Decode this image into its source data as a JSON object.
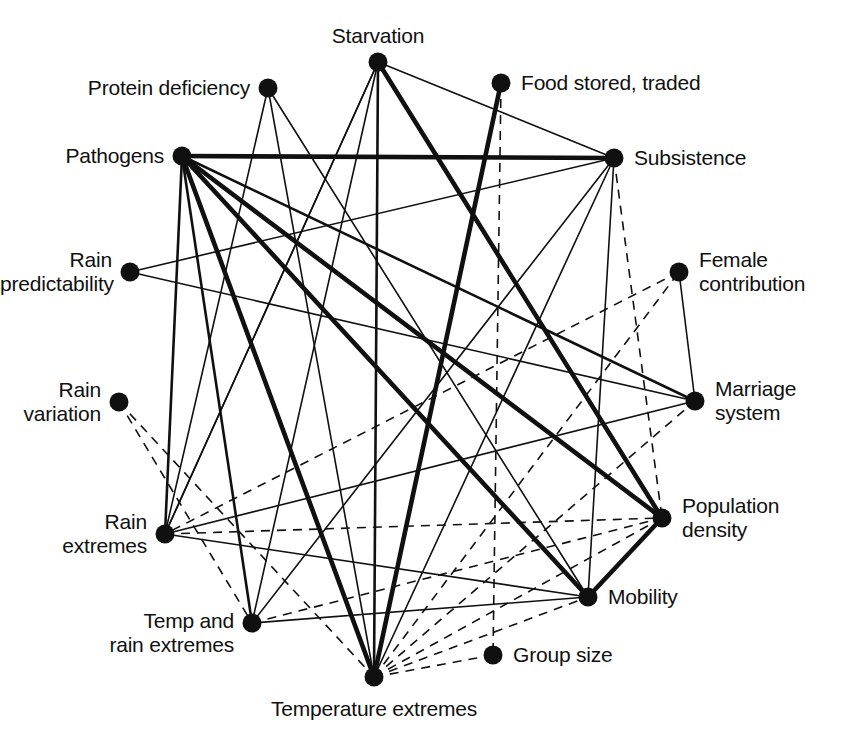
{
  "figure": {
    "type": "network-diagram",
    "title": "",
    "background_color": "#ffffff",
    "ink_color": "#101010",
    "width": 843,
    "height": 736
  },
  "legend_note": {
    "solid_meaning": "solid line",
    "dashed_meaning": "dashed line",
    "thickness_meaning": "line thickness indicates strength of association"
  },
  "nodes": [
    {
      "id": "starvation",
      "label": "Starvation",
      "x": 378,
      "y": 62,
      "label_x": 378,
      "label_y": 24,
      "label_align": "center"
    },
    {
      "id": "protein",
      "label": "Protein deficiency",
      "x": 268,
      "y": 88,
      "label_x": 250,
      "label_y": 76,
      "label_align": "right"
    },
    {
      "id": "food_stored",
      "label": "Food stored, traded",
      "x": 501,
      "y": 83,
      "label_x": 521,
      "label_y": 71,
      "label_align": "left"
    },
    {
      "id": "pathogens",
      "label": "Pathogens",
      "x": 182,
      "y": 156,
      "label_x": 164,
      "label_y": 144,
      "label_align": "right"
    },
    {
      "id": "subsistence",
      "label": "Subsistence",
      "x": 614,
      "y": 158,
      "label_x": 634,
      "label_y": 146,
      "label_align": "left"
    },
    {
      "id": "rain_pred",
      "label": "Rain\npredictability",
      "x": 130,
      "y": 272,
      "label_x": 112,
      "label_y": 248,
      "label_align": "right"
    },
    {
      "id": "female_contrib",
      "label": "Female\ncontribution",
      "x": 679,
      "y": 272,
      "label_x": 699,
      "label_y": 248,
      "label_align": "left"
    },
    {
      "id": "marriage",
      "label": "Marriage\nsystem",
      "x": 695,
      "y": 401,
      "label_x": 715,
      "label_y": 377,
      "label_align": "left"
    },
    {
      "id": "rain_var",
      "label": "Rain\nvariation",
      "x": 119,
      "y": 402,
      "label_x": 101,
      "label_y": 378,
      "label_align": "right"
    },
    {
      "id": "pop_density",
      "label": "Population\ndensity",
      "x": 662,
      "y": 518,
      "label_x": 682,
      "label_y": 494,
      "label_align": "left"
    },
    {
      "id": "rain_extremes",
      "label": "Rain\nextremes",
      "x": 165,
      "y": 534,
      "label_x": 147,
      "label_y": 510,
      "label_align": "right"
    },
    {
      "id": "temp_rain_extr",
      "label": "Temp and\nrain extremes",
      "x": 252,
      "y": 623,
      "label_x": 234,
      "label_y": 609,
      "label_align": "right"
    },
    {
      "id": "mobility",
      "label": "Mobility",
      "x": 588,
      "y": 597,
      "label_x": 608,
      "label_y": 585,
      "label_align": "left"
    },
    {
      "id": "group_size",
      "label": "Group size",
      "x": 493,
      "y": 655,
      "label_x": 513,
      "label_y": 643,
      "label_align": "left"
    },
    {
      "id": "temperature_extr",
      "label": "Temperature extremes",
      "x": 374,
      "y": 677,
      "label_x": 374,
      "label_y": 697,
      "label_align": "center"
    }
  ],
  "edges": [
    {
      "source": "pathogens",
      "target": "subsistence",
      "style": "solid",
      "weight": "thick"
    },
    {
      "source": "pathogens",
      "target": "temperature_extr",
      "style": "solid",
      "weight": "thick"
    },
    {
      "source": "pathogens",
      "target": "mobility",
      "style": "solid",
      "weight": "thick"
    },
    {
      "source": "pathogens",
      "target": "pop_density",
      "style": "solid",
      "weight": "thick"
    },
    {
      "source": "pathogens",
      "target": "marriage",
      "style": "solid",
      "weight": "med"
    },
    {
      "source": "pathogens",
      "target": "temp_rain_extr",
      "style": "solid",
      "weight": "med"
    },
    {
      "source": "pathogens",
      "target": "rain_extremes",
      "style": "solid",
      "weight": "med"
    },
    {
      "source": "starvation",
      "target": "subsistence",
      "style": "solid",
      "weight": "thin"
    },
    {
      "source": "starvation",
      "target": "temperature_extr",
      "style": "solid",
      "weight": "med"
    },
    {
      "source": "starvation",
      "target": "rain_extremes",
      "style": "solid",
      "weight": "thin"
    },
    {
      "source": "starvation",
      "target": "pop_density",
      "style": "solid",
      "weight": "thick"
    },
    {
      "source": "starvation",
      "target": "temp_rain_extr",
      "style": "solid",
      "weight": "thin"
    },
    {
      "source": "protein",
      "target": "temperature_extr",
      "style": "solid",
      "weight": "thin"
    },
    {
      "source": "protein",
      "target": "mobility",
      "style": "solid",
      "weight": "thin"
    },
    {
      "source": "food_stored",
      "target": "temperature_extr",
      "style": "solid",
      "weight": "thick"
    },
    {
      "source": "food_stored",
      "target": "group_size",
      "style": "dashed",
      "weight": "thin"
    },
    {
      "source": "subsistence",
      "target": "temperature_extr",
      "style": "solid",
      "weight": "thin"
    },
    {
      "source": "subsistence",
      "target": "temp_rain_extr",
      "style": "solid",
      "weight": "thin"
    },
    {
      "source": "subsistence",
      "target": "pop_density",
      "style": "dashed",
      "weight": "thin"
    },
    {
      "source": "rain_pred",
      "target": "marriage",
      "style": "solid",
      "weight": "thin"
    },
    {
      "source": "rain_pred",
      "target": "subsistence",
      "style": "solid",
      "weight": "thin"
    },
    {
      "source": "rain_var",
      "target": "temperature_extr",
      "style": "dashed",
      "weight": "thin"
    },
    {
      "source": "rain_extremes",
      "target": "pop_density",
      "style": "dashed",
      "weight": "thin"
    },
    {
      "source": "rain_extremes",
      "target": "mobility",
      "style": "solid",
      "weight": "thin"
    },
    {
      "source": "rain_extremes",
      "target": "starvation",
      "style": "solid",
      "weight": "thin"
    },
    {
      "source": "temp_rain_extr",
      "target": "mobility",
      "style": "solid",
      "weight": "thin"
    },
    {
      "source": "temp_rain_extr",
      "target": "pop_density",
      "style": "dashed",
      "weight": "thin"
    },
    {
      "source": "temperature_extr",
      "target": "mobility",
      "style": "dashed",
      "weight": "thin"
    },
    {
      "source": "temperature_extr",
      "target": "group_size",
      "style": "dashed",
      "weight": "thin"
    },
    {
      "source": "temperature_extr",
      "target": "pop_density",
      "style": "dashed",
      "weight": "thin"
    },
    {
      "source": "temperature_extr",
      "target": "marriage",
      "style": "dashed",
      "weight": "thin"
    },
    {
      "source": "temperature_extr",
      "target": "female_contrib",
      "style": "dashed",
      "weight": "thin"
    },
    {
      "source": "female_contrib",
      "target": "marriage",
      "style": "solid",
      "weight": "thin"
    },
    {
      "source": "female_contrib",
      "target": "rain_extremes",
      "style": "dashed",
      "weight": "thin"
    },
    {
      "source": "mobility",
      "target": "pop_density",
      "style": "solid",
      "weight": "thick"
    },
    {
      "source": "mobility",
      "target": "subsistence",
      "style": "solid",
      "weight": "thin"
    },
    {
      "source": "marriage",
      "target": "rain_extremes",
      "style": "solid",
      "weight": "thin"
    },
    {
      "source": "protein",
      "target": "rain_extremes",
      "style": "solid",
      "weight": "thin"
    },
    {
      "source": "rain_var",
      "target": "temp_rain_extr",
      "style": "dashed",
      "weight": "thin"
    }
  ],
  "node_radius": 9.5
}
